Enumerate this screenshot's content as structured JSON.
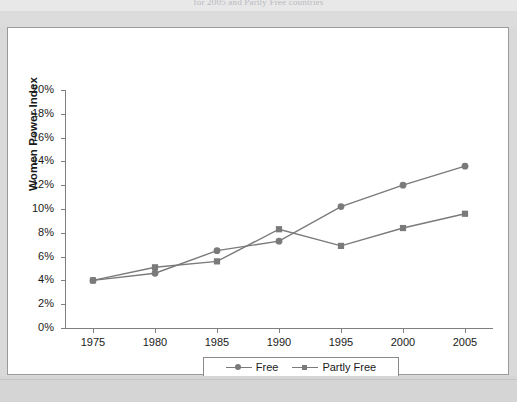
{
  "page": {
    "caption_above": "for 2005 and Partly Free countries",
    "background_color": "#d9d9d9",
    "panel_color": "#ffffff"
  },
  "chart_data": {
    "type": "line",
    "title": "",
    "xlabel": "",
    "ylabel": "Women Power Index",
    "x": [
      1975,
      1980,
      1985,
      1990,
      1995,
      2000,
      2005
    ],
    "xtick_labels": [
      "1975",
      "1980",
      "1985",
      "1990",
      "1995",
      "2000",
      "2005"
    ],
    "ytick_labels": [
      "0%",
      "2%",
      "4%",
      "6%",
      "8%",
      "10%",
      "12%",
      "14%",
      "16%",
      "18%",
      "20%"
    ],
    "ytick_values": [
      0,
      2,
      4,
      6,
      8,
      10,
      12,
      14,
      16,
      18,
      20
    ],
    "ylim": [
      0,
      20
    ],
    "xlim": [
      1975,
      2005
    ],
    "grid": false,
    "legend_position": "bottom-center",
    "series": [
      {
        "name": "Free",
        "marker": "circle",
        "color": "#7a7a7a",
        "values": [
          4.0,
          4.6,
          6.5,
          7.3,
          10.2,
          12.0,
          13.6
        ]
      },
      {
        "name": "Partly Free",
        "marker": "square",
        "color": "#7a7a7a",
        "values": [
          4.0,
          5.1,
          5.6,
          8.3,
          6.9,
          8.4,
          9.6
        ]
      }
    ]
  },
  "legend": {
    "items": [
      {
        "label": "Free",
        "marker": "circle"
      },
      {
        "label": "Partly Free",
        "marker": "square"
      }
    ]
  }
}
